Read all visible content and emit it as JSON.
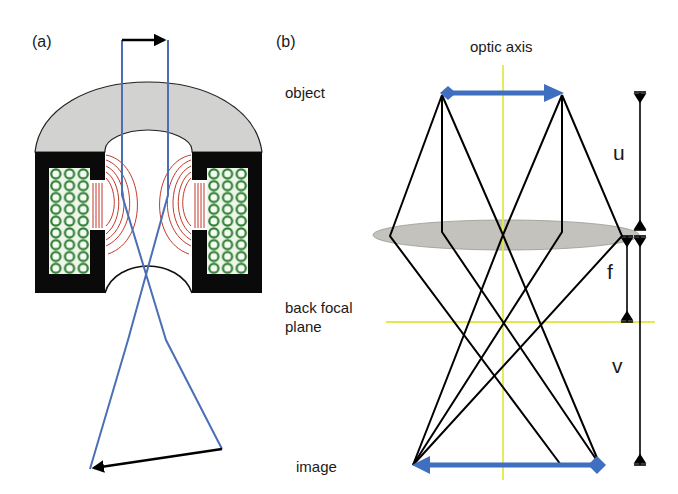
{
  "panels": {
    "a": {
      "label": "(a)",
      "description": "magnetic lens cross-section with electron ray paths",
      "colors": {
        "pole_piece": "#000000",
        "yoke": "#d2d2d0",
        "coil": "#2e7d32",
        "field_lines": "#c0392b",
        "rays": "#4a6fb5",
        "arrows": "#000000"
      }
    },
    "b": {
      "label": "(b)",
      "labels": {
        "optic_axis": "optic axis",
        "object": "object",
        "back_focal_plane_line1": "back focal",
        "back_focal_plane_line2": "plane",
        "image": "image"
      },
      "dimensions": {
        "u": "u",
        "f": "f",
        "v": "v"
      },
      "colors": {
        "object_image_arrow": "#3f6fbf",
        "axis_and_focal_plane": "#e4e84a",
        "lens": "#c4c2bd",
        "rays": "#000000"
      }
    }
  }
}
